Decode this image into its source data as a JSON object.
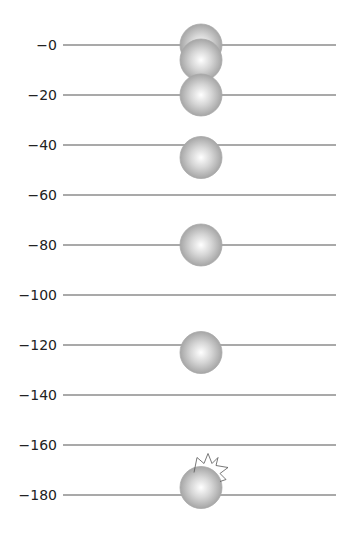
{
  "diagram": {
    "type": "stroboscopic-free-fall",
    "colors": {
      "line": "#555555",
      "ball_highlight": "#ffffff",
      "ball_mid": "#c8c8c8",
      "ball_edge": "#9a9a9a",
      "impact_outline": "#555555"
    },
    "scale": {
      "labels": [
        "-0",
        "-20",
        "-40",
        "-60",
        "-80",
        "-100",
        "-120",
        "-140",
        "-160",
        "-180"
      ],
      "values": [
        0,
        -20,
        -40,
        -60,
        -80,
        -100,
        -120,
        -140,
        -160,
        -180
      ],
      "unit": ""
    },
    "ball_positions": [
      0,
      -6,
      -20,
      -45,
      -80,
      -123,
      -177
    ],
    "impact_mark": {
      "at_position": -177,
      "shape": "starburst"
    }
  },
  "chart_data": {
    "type": "scatter",
    "title": "",
    "xlabel": "",
    "ylabel": "",
    "ylim": [
      -190,
      5
    ],
    "y_ticks": [
      0,
      -20,
      -40,
      -60,
      -80,
      -100,
      -120,
      -140,
      -160,
      -180
    ],
    "series": [
      {
        "name": "ball position",
        "values": [
          0,
          -6,
          -20,
          -45,
          -80,
          -123,
          -177
        ]
      }
    ],
    "grid": true
  }
}
